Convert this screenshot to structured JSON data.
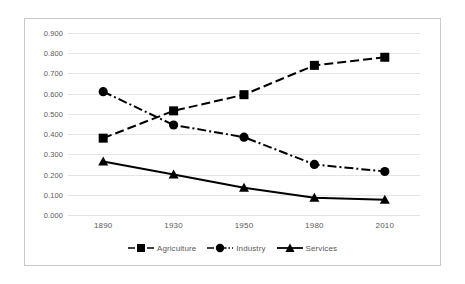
{
  "chart_data": {
    "type": "line",
    "title": "",
    "xlabel": "",
    "ylabel": "",
    "categories": [
      "1890",
      "1930",
      "1950",
      "1980",
      "2010"
    ],
    "ylim": [
      0.0,
      0.9
    ],
    "ytick_labels": [
      "0.900",
      "0.800",
      "0.700",
      "0.600",
      "0.500",
      "0.400",
      "0.300",
      "0.200",
      "0.100",
      "0.000"
    ],
    "ytick_values": [
      0.9,
      0.8,
      0.7,
      0.6,
      0.5,
      0.4,
      0.3,
      0.2,
      0.1,
      0.0
    ],
    "grid": true,
    "legend_position": "bottom",
    "series": [
      {
        "name": "Agriculture",
        "marker": "square",
        "line_style": "dashed",
        "color": "#000000",
        "values": [
          0.38,
          0.515,
          0.595,
          0.74,
          0.78
        ]
      },
      {
        "name": "Industry",
        "marker": "circle",
        "line_style": "dash-dot",
        "color": "#000000",
        "values": [
          0.61,
          0.445,
          0.385,
          0.25,
          0.215
        ]
      },
      {
        "name": "Services",
        "marker": "triangle",
        "line_style": "solid",
        "color": "#000000",
        "values": [
          0.265,
          0.2,
          0.135,
          0.085,
          0.075
        ]
      }
    ]
  },
  "legend": {
    "items": [
      {
        "label": "Agriculture"
      },
      {
        "label": "Industry"
      },
      {
        "label": "Services"
      }
    ]
  }
}
